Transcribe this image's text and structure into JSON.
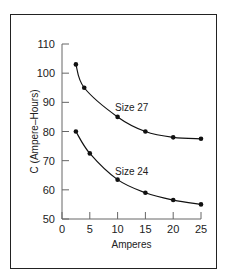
{
  "chart_data": {
    "type": "line",
    "title": "",
    "xlabel": "Amperes",
    "ylabel": "C (Ampere–Hours)",
    "xlim": [
      0,
      25
    ],
    "ylim": [
      50,
      110
    ],
    "xticks": [
      "0",
      "5",
      "10",
      "15",
      "20",
      "25"
    ],
    "yticks": [
      "50",
      "60",
      "70",
      "80",
      "90",
      "100",
      "110"
    ],
    "grid": false,
    "series": [
      {
        "name": "Size 27",
        "x": [
          2.5,
          4,
          10,
          15,
          20,
          25
        ],
        "values": [
          103,
          95,
          85,
          80,
          78,
          77.5
        ]
      },
      {
        "name": "Size 24",
        "x": [
          2.5,
          5,
          10,
          15,
          20,
          25
        ],
        "values": [
          80,
          72.5,
          63.5,
          59,
          56.5,
          55
        ]
      }
    ]
  }
}
